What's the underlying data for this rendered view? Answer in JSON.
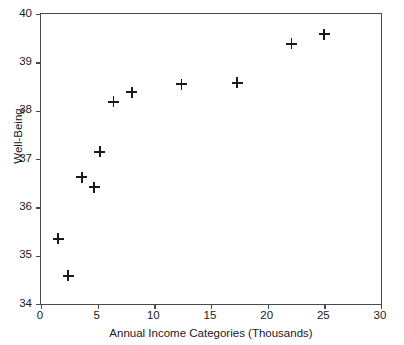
{
  "chart_data": {
    "type": "scatter",
    "title": "",
    "xlabel": "Annual Income Categories (Thousands)",
    "ylabel": "Well-Being",
    "xlim": [
      0,
      30
    ],
    "ylim": [
      34,
      40
    ],
    "xticks": [
      0,
      5,
      10,
      15,
      20,
      25,
      30
    ],
    "yticks": [
      34,
      35,
      36,
      37,
      38,
      39,
      40
    ],
    "xtick_labels": [
      "0",
      "5",
      "10",
      "15",
      "20",
      "25",
      "30"
    ],
    "ytick_labels": [
      "34",
      "35",
      "36",
      "37",
      "38",
      "39",
      "40"
    ],
    "grid": false,
    "legend": null,
    "marker": "plus",
    "marker_color": "#1a1a1a",
    "points": [
      {
        "x": 1.5,
        "y": 35.35
      },
      {
        "x": 2.4,
        "y": 34.58
      },
      {
        "x": 3.6,
        "y": 36.62
      },
      {
        "x": 4.7,
        "y": 36.42
      },
      {
        "x": 5.2,
        "y": 37.15
      },
      {
        "x": 6.4,
        "y": 38.18
      },
      {
        "x": 8.0,
        "y": 38.38
      },
      {
        "x": 12.4,
        "y": 38.55
      },
      {
        "x": 17.3,
        "y": 38.58
      },
      {
        "x": 22.1,
        "y": 39.38
      },
      {
        "x": 25.0,
        "y": 39.58
      }
    ]
  }
}
